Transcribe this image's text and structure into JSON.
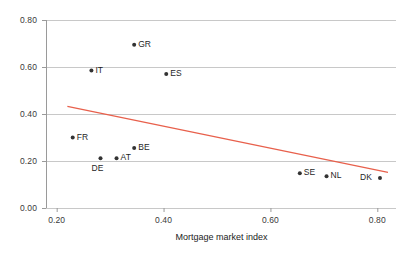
{
  "chart_data": {
    "type": "scatter",
    "title": "",
    "xlabel": "Mortgage market index",
    "ylabel": "",
    "xlim": [
      0.18,
      0.835
    ],
    "ylim": [
      0.0,
      0.8
    ],
    "xticks": [
      "0.20",
      "0.40",
      "0.60",
      "0.80"
    ],
    "yticks": [
      "0.00",
      "0.20",
      "0.40",
      "0.60",
      "0.80"
    ],
    "xtick_values": [
      0.2,
      0.4,
      0.6,
      0.8
    ],
    "ytick_values": [
      0.0,
      0.2,
      0.4,
      0.6,
      0.8
    ],
    "grid": "horizontal",
    "legend": "none",
    "point_color": "#333333",
    "trendline_color": "#e8604c",
    "grid_color": "#c8c8c8",
    "axis_color": "#9a9a9a",
    "points": [
      {
        "label": "GR",
        "x": 0.345,
        "y": 0.695,
        "label_side": "right"
      },
      {
        "label": "IT",
        "x": 0.265,
        "y": 0.585,
        "label_side": "right"
      },
      {
        "label": "ES",
        "x": 0.405,
        "y": 0.57,
        "label_side": "right"
      },
      {
        "label": "FR",
        "x": 0.23,
        "y": 0.3,
        "label_side": "right"
      },
      {
        "label": "BE",
        "x": 0.345,
        "y": 0.255,
        "label_side": "right"
      },
      {
        "label": "AT",
        "x": 0.312,
        "y": 0.212,
        "label_side": "right"
      },
      {
        "label": "DE",
        "x": 0.282,
        "y": 0.212,
        "label_side": "below"
      },
      {
        "label": "SE",
        "x": 0.655,
        "y": 0.148,
        "label_side": "right"
      },
      {
        "label": "NL",
        "x": 0.705,
        "y": 0.135,
        "label_side": "right"
      },
      {
        "label": "DK",
        "x": 0.805,
        "y": 0.128,
        "label_side": "left"
      }
    ],
    "trendline": {
      "x_start": 0.22,
      "y_start": 0.432,
      "x_end": 0.82,
      "y_end": 0.152
    }
  }
}
